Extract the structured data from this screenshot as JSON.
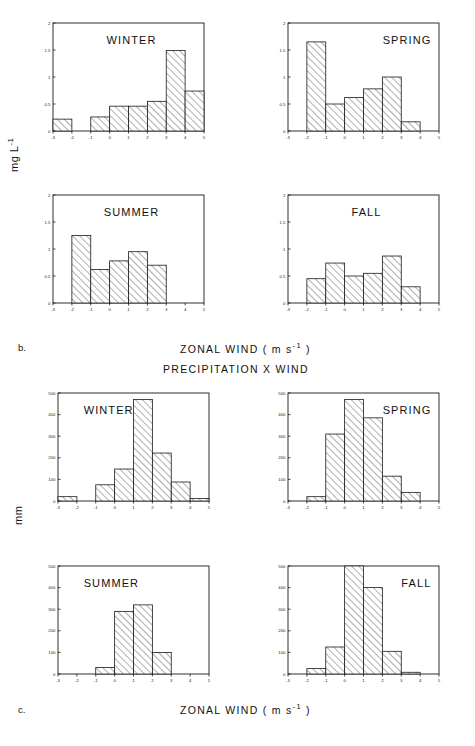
{
  "figure": {
    "panel_b_label": "b.",
    "panel_c_label": "c.",
    "group_b_axis_title_main": "ZONAL WIND  ( m s",
    "group_b_axis_title_sup": "-1",
    "group_b_axis_title_tail": " )",
    "group_c_axis_title_main": "ZONAL WIND  ( m s",
    "group_c_axis_title_sup": "-1",
    "group_c_axis_title_tail": " )",
    "group_c_title": "PRECIPITATION  X  WIND",
    "ylabel_b_main": "mg  L",
    "ylabel_b_sup": "-1",
    "ylabel_c": "mm"
  },
  "chart_data": [
    {
      "type": "bar",
      "id": "b-winter",
      "title": "WINTER",
      "title_position": "top-center",
      "xlabel": "ZONAL WIND (m s-1)",
      "ylabel": "mg L-1",
      "xlim": [
        -3,
        5
      ],
      "ylim": [
        0,
        2
      ],
      "xticks": [
        -3,
        -2,
        -1,
        0,
        1,
        2,
        3,
        4,
        5
      ],
      "xtick_labels": [
        "-3",
        "-2",
        "-1",
        "0",
        "1",
        "2",
        "3",
        "4",
        "5"
      ],
      "yticks": [
        0,
        0.5,
        1,
        1.5,
        2
      ],
      "ytick_labels": [
        "0",
        "0.5",
        "1",
        "1.5",
        "2"
      ],
      "grid": false,
      "bin_edges": [
        -3,
        -2,
        -1,
        0,
        1,
        2,
        3,
        4,
        5
      ],
      "values": [
        0.22,
        0.0,
        0.26,
        0.46,
        0.46,
        0.55,
        1.49,
        0.74
      ]
    },
    {
      "type": "bar",
      "id": "b-spring",
      "title": "SPRING",
      "title_position": "top-right",
      "xlabel": "ZONAL WIND (m s-1)",
      "ylabel": "mg L-1",
      "xlim": [
        -3,
        5
      ],
      "ylim": [
        0,
        2
      ],
      "xticks": [
        -3,
        -2,
        -1,
        0,
        1,
        2,
        3,
        4,
        5
      ],
      "xtick_labels": [
        "-3",
        "-2",
        "-1",
        "0",
        "1",
        "2",
        "3",
        "4",
        "5"
      ],
      "yticks": [
        0,
        0.5,
        1,
        1.5,
        2
      ],
      "ytick_labels": [
        "0",
        "0.5",
        "1",
        "1.5",
        "2"
      ],
      "grid": false,
      "bin_edges": [
        -3,
        -2,
        -1,
        0,
        1,
        2,
        3,
        4,
        5
      ],
      "values": [
        0.0,
        1.65,
        0.5,
        0.62,
        0.78,
        1.0,
        0.17,
        0.0
      ]
    },
    {
      "type": "bar",
      "id": "b-summer",
      "title": "SUMMER",
      "title_position": "top-center",
      "xlabel": "ZONAL WIND (m s-1)",
      "ylabel": "mg L-1",
      "xlim": [
        -3,
        5
      ],
      "ylim": [
        0,
        2
      ],
      "xticks": [
        -3,
        -2,
        -1,
        0,
        1,
        2,
        3,
        4,
        5
      ],
      "xtick_labels": [
        "-3",
        "-2",
        "-1",
        "0",
        "1",
        "2",
        "3",
        "4",
        "5"
      ],
      "yticks": [
        0,
        0.5,
        1,
        1.5,
        2
      ],
      "ytick_labels": [
        "0",
        "0.5",
        "1",
        "1.5",
        "2"
      ],
      "grid": false,
      "bin_edges": [
        -3,
        -2,
        -1,
        0,
        1,
        2,
        3,
        4,
        5
      ],
      "values": [
        0.0,
        1.25,
        0.62,
        0.78,
        0.95,
        0.7,
        0.0,
        0.0
      ]
    },
    {
      "type": "bar",
      "id": "b-fall",
      "title": "FALL",
      "title_position": "top-center",
      "xlabel": "ZONAL WIND (m s-1)",
      "ylabel": "mg L-1",
      "xlim": [
        -3,
        5
      ],
      "ylim": [
        0,
        2
      ],
      "xticks": [
        -3,
        -2,
        -1,
        0,
        1,
        2,
        3,
        4,
        5
      ],
      "xtick_labels": [
        "-3",
        "-2",
        "-1",
        "0",
        "1",
        "2",
        "3",
        "4",
        "5"
      ],
      "yticks": [
        0,
        0.5,
        1,
        1.5,
        2
      ],
      "ytick_labels": [
        "0",
        "0.5",
        "1",
        "1.5",
        "2"
      ],
      "grid": false,
      "bin_edges": [
        -3,
        -2,
        -1,
        0,
        1,
        2,
        3,
        4,
        5
      ],
      "values": [
        0.0,
        0.45,
        0.74,
        0.5,
        0.55,
        0.87,
        0.3,
        0.0
      ]
    },
    {
      "type": "bar",
      "id": "c-winter",
      "title": "WINTER",
      "title_position": "top-left",
      "xlabel": "ZONAL WIND (m s-1)",
      "ylabel": "mm",
      "xlim": [
        -3,
        5
      ],
      "ylim": [
        0,
        500
      ],
      "xticks": [
        -3,
        -2,
        -1,
        0,
        1,
        2,
        3,
        4,
        5
      ],
      "xtick_labels": [
        "-3",
        "-2",
        "-1",
        "0",
        "1",
        "2",
        "3",
        "4",
        "5"
      ],
      "yticks": [
        0,
        100,
        200,
        300,
        400,
        500
      ],
      "ytick_labels": [
        "0",
        "100",
        "200",
        "300",
        "400",
        "500"
      ],
      "grid": false,
      "bin_edges": [
        -3,
        -2,
        -1,
        0,
        1,
        2,
        3,
        4,
        5
      ],
      "values": [
        20,
        0,
        75,
        148,
        470,
        222,
        88,
        12
      ]
    },
    {
      "type": "bar",
      "id": "c-spring",
      "title": "SPRING",
      "title_position": "top-right",
      "xlabel": "ZONAL WIND (m s-1)",
      "ylabel": "mm",
      "xlim": [
        -3,
        5
      ],
      "ylim": [
        0,
        500
      ],
      "xticks": [
        -3,
        -2,
        -1,
        0,
        1,
        2,
        3,
        4,
        5
      ],
      "xtick_labels": [
        "-3",
        "-2",
        "-1",
        "0",
        "1",
        "2",
        "3",
        "4",
        "5"
      ],
      "yticks": [
        0,
        100,
        200,
        300,
        400,
        500
      ],
      "ytick_labels": [
        "0",
        "100",
        "200",
        "300",
        "400",
        "500"
      ],
      "grid": false,
      "bin_edges": [
        -3,
        -2,
        -1,
        0,
        1,
        2,
        3,
        4,
        5
      ],
      "values": [
        0,
        20,
        310,
        470,
        385,
        115,
        40,
        0
      ]
    },
    {
      "type": "bar",
      "id": "c-summer",
      "title": "SUMMER",
      "title_position": "top-left",
      "xlabel": "ZONAL WIND (m s-1)",
      "ylabel": "mm",
      "xlim": [
        -3,
        5
      ],
      "ylim": [
        0,
        500
      ],
      "xticks": [
        -3,
        -2,
        -1,
        0,
        1,
        2,
        3,
        4,
        5
      ],
      "xtick_labels": [
        "-3",
        "-2",
        "-1",
        "0",
        "1",
        "2",
        "3",
        "4",
        "5"
      ],
      "yticks": [
        0,
        100,
        200,
        300,
        400,
        500
      ],
      "ytick_labels": [
        "0",
        "100",
        "200",
        "300",
        "400",
        "500"
      ],
      "grid": false,
      "bin_edges": [
        -3,
        -2,
        -1,
        0,
        1,
        2,
        3,
        4,
        5
      ],
      "values": [
        0,
        0,
        30,
        290,
        320,
        100,
        0,
        0
      ]
    },
    {
      "type": "bar",
      "id": "c-fall",
      "title": "FALL",
      "title_position": "top-right",
      "xlabel": "ZONAL WIND (m s-1)",
      "ylabel": "mm",
      "xlim": [
        -3,
        5
      ],
      "ylim": [
        0,
        500
      ],
      "xticks": [
        -3,
        -2,
        -1,
        0,
        1,
        2,
        3,
        4,
        5
      ],
      "xtick_labels": [
        "-3",
        "-2",
        "-1",
        "0",
        "1",
        "2",
        "3",
        "4",
        "5"
      ],
      "yticks": [
        0,
        100,
        200,
        300,
        400,
        500
      ],
      "ytick_labels": [
        "0",
        "100",
        "200",
        "300",
        "400",
        "500"
      ],
      "grid": false,
      "bin_edges": [
        -3,
        -2,
        -1,
        0,
        1,
        2,
        3,
        4,
        5
      ],
      "values": [
        0,
        25,
        125,
        500,
        400,
        105,
        8,
        0
      ]
    }
  ]
}
